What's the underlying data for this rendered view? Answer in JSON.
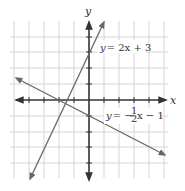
{
  "figure": {
    "type": "coordinate-graph",
    "axes": {
      "x_label": "x",
      "y_label": "y"
    },
    "grid": {
      "x_range": [
        -5,
        5
      ],
      "y_range": [
        -5,
        5
      ],
      "unit": 1
    },
    "lines": [
      {
        "equation": "y = 2x + 3",
        "label_y": "y",
        "label_rhs": "= 2x + 3",
        "slope": 2,
        "intercept": 3,
        "color": "#666666"
      },
      {
        "equation": "y = -1/2 x - 1",
        "label_y": "y",
        "label_rhs": "= −",
        "frac_num": "1",
        "frac_den": "2",
        "label_tail": "x − 1",
        "slope": -0.5,
        "intercept": -1,
        "color": "#666666"
      }
    ],
    "colors": {
      "grid": "#d4d4d4",
      "axis": "#333333",
      "line": "#666666"
    }
  }
}
